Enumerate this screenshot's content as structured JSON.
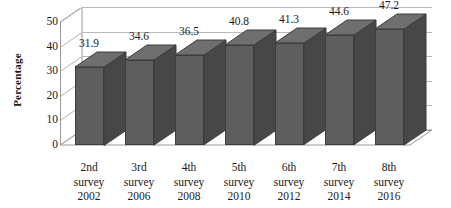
{
  "chart_data": {
    "type": "bar",
    "title": "",
    "subtitle": "",
    "xlabel": "",
    "ylabel": "Percentage",
    "categories": [
      "2nd survey 2002",
      "3rd survey 2006",
      "4th survey 2008",
      "5th survey 2010",
      "6th survey 2012",
      "7th survey 2014",
      "8th survey 2016"
    ],
    "category_lines": [
      [
        "2nd",
        "survey",
        "2002"
      ],
      [
        "3rd",
        "survey",
        "2006"
      ],
      [
        "4th",
        "survey",
        "2008"
      ],
      [
        "5th",
        "survey",
        "2010"
      ],
      [
        "6th",
        "survey",
        "2012"
      ],
      [
        "7th",
        "survey",
        "2014"
      ],
      [
        "8th",
        "survey",
        "2016"
      ]
    ],
    "values": [
      31.9,
      34.6,
      36.5,
      40.8,
      41.3,
      44.6,
      47.2
    ],
    "data_labels": [
      "31.9",
      "34.6",
      "36.5",
      "40.8",
      "41.3",
      "44.6",
      "47.2"
    ],
    "ylim": [
      0,
      50
    ],
    "ytick_values": [
      0,
      10,
      20,
      30,
      40,
      50
    ],
    "ytick_labels": [
      "0",
      "10",
      "20",
      "30",
      "40",
      "50"
    ],
    "grid": true,
    "grid_axis": "y",
    "legend": false,
    "legend_position": "none",
    "three_d": true,
    "colors": {
      "bar_front": "#5e5e5e",
      "bar_side": "#474747",
      "bar_top": "#6f6f6f",
      "bar_outline": "#3d3d3d",
      "gridline": "#b9b9b9",
      "axis_line": "#9a9a9a",
      "text": "#1a1a1a",
      "background": "#ffffff"
    }
  }
}
